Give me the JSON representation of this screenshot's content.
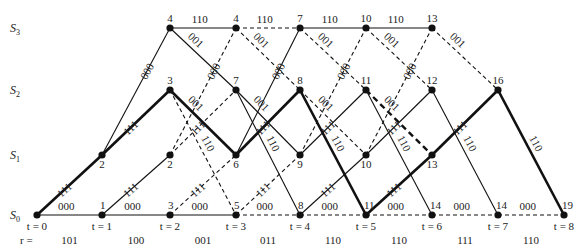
{
  "states": [
    {
      "id": "S0",
      "label": "S",
      "sub": "0"
    },
    {
      "id": "S1",
      "label": "S",
      "sub": "1"
    },
    {
      "id": "S2",
      "label": "S",
      "sub": "2"
    },
    {
      "id": "S3",
      "label": "S",
      "sub": "3"
    }
  ],
  "time_labels": [
    "t = 0",
    "t = 1",
    "t = 2",
    "t = 3",
    "t = 4",
    "t = 5",
    "t = 6",
    "t = 7",
    "t = 8"
  ],
  "received_prefix": "r =",
  "received": [
    "101",
    "100",
    "001",
    "011",
    "110",
    "110",
    "111",
    "110"
  ],
  "nodes": [
    {
      "t": 0,
      "s": 0,
      "metric": ""
    },
    {
      "t": 1,
      "s": 0,
      "metric": "1"
    },
    {
      "t": 1,
      "s": 1,
      "metric": "2"
    },
    {
      "t": 2,
      "s": 0,
      "metric": "3"
    },
    {
      "t": 2,
      "s": 1,
      "metric": "2"
    },
    {
      "t": 2,
      "s": 2,
      "metric": "3"
    },
    {
      "t": 2,
      "s": 3,
      "metric": "4"
    },
    {
      "t": 3,
      "s": 0,
      "metric": "5"
    },
    {
      "t": 3,
      "s": 1,
      "metric": "6"
    },
    {
      "t": 3,
      "s": 2,
      "metric": "7"
    },
    {
      "t": 3,
      "s": 3,
      "metric": "4"
    },
    {
      "t": 4,
      "s": 0,
      "metric": "8"
    },
    {
      "t": 4,
      "s": 1,
      "metric": "9"
    },
    {
      "t": 4,
      "s": 2,
      "metric": "8"
    },
    {
      "t": 4,
      "s": 3,
      "metric": "7"
    },
    {
      "t": 5,
      "s": 0,
      "metric": "11"
    },
    {
      "t": 5,
      "s": 1,
      "metric": "10"
    },
    {
      "t": 5,
      "s": 2,
      "metric": "11"
    },
    {
      "t": 5,
      "s": 3,
      "metric": "10"
    },
    {
      "t": 6,
      "s": 0,
      "metric": "14"
    },
    {
      "t": 6,
      "s": 1,
      "metric": "13"
    },
    {
      "t": 6,
      "s": 2,
      "metric": "12"
    },
    {
      "t": 6,
      "s": 3,
      "metric": "13"
    },
    {
      "t": 7,
      "s": 0,
      "metric": "14"
    },
    {
      "t": 7,
      "s": 2,
      "metric": "16"
    },
    {
      "t": 8,
      "s": 0,
      "metric": "19"
    }
  ],
  "edges": [
    {
      "t": 0,
      "from": 0,
      "to": 0,
      "label": "000",
      "style": "normal"
    },
    {
      "t": 0,
      "from": 0,
      "to": 1,
      "label": "111",
      "style": "bold"
    },
    {
      "t": 1,
      "from": 0,
      "to": 0,
      "label": "000",
      "style": "normal"
    },
    {
      "t": 1,
      "from": 0,
      "to": 1,
      "label": "111",
      "style": "normal"
    },
    {
      "t": 1,
      "from": 1,
      "to": 2,
      "label": "111",
      "style": "bold"
    },
    {
      "t": 1,
      "from": 1,
      "to": 3,
      "label": "000",
      "style": "normal"
    },
    {
      "t": 2,
      "from": 0,
      "to": 0,
      "label": "000",
      "style": "normal"
    },
    {
      "t": 2,
      "from": 0,
      "to": 1,
      "label": "111",
      "style": "dashed"
    },
    {
      "t": 2,
      "from": 1,
      "to": 2,
      "label": "111",
      "style": "dashed"
    },
    {
      "t": 2,
      "from": 1,
      "to": 3,
      "label": "000",
      "style": "dashed"
    },
    {
      "t": 2,
      "from": 2,
      "to": 0,
      "label": "110",
      "style": "dashed"
    },
    {
      "t": 2,
      "from": 2,
      "to": 1,
      "label": "001",
      "style": "bold"
    },
    {
      "t": 2,
      "from": 3,
      "to": 2,
      "label": "001",
      "style": "normal"
    },
    {
      "t": 2,
      "from": 3,
      "to": 3,
      "label": "110",
      "style": "normal"
    },
    {
      "t": 3,
      "from": 0,
      "to": 0,
      "label": "000",
      "style": "dashed"
    },
    {
      "t": 3,
      "from": 0,
      "to": 1,
      "label": "111",
      "style": "dashed"
    },
    {
      "t": 3,
      "from": 1,
      "to": 2,
      "label": "111",
      "style": "bold"
    },
    {
      "t": 3,
      "from": 1,
      "to": 3,
      "label": "000",
      "style": "normal"
    },
    {
      "t": 3,
      "from": 2,
      "to": 0,
      "label": "110",
      "style": "normal"
    },
    {
      "t": 3,
      "from": 2,
      "to": 1,
      "label": "001",
      "style": "normal"
    },
    {
      "t": 3,
      "from": 3,
      "to": 2,
      "label": "001",
      "style": "dashed"
    },
    {
      "t": 3,
      "from": 3,
      "to": 3,
      "label": "110",
      "style": "dashed"
    },
    {
      "t": 4,
      "from": 0,
      "to": 0,
      "label": "000",
      "style": "dashed"
    },
    {
      "t": 4,
      "from": 0,
      "to": 1,
      "label": "111",
      "style": "normal"
    },
    {
      "t": 4,
      "from": 1,
      "to": 2,
      "label": "111",
      "style": "normal"
    },
    {
      "t": 4,
      "from": 1,
      "to": 3,
      "label": "000",
      "style": "dashed"
    },
    {
      "t": 4,
      "from": 2,
      "to": 0,
      "label": "110",
      "style": "bold"
    },
    {
      "t": 4,
      "from": 2,
      "to": 1,
      "label": "001",
      "style": "dashed"
    },
    {
      "t": 4,
      "from": 3,
      "to": 2,
      "label": "001",
      "style": "dashed"
    },
    {
      "t": 4,
      "from": 3,
      "to": 3,
      "label": "110",
      "style": "normal"
    },
    {
      "t": 5,
      "from": 0,
      "to": 0,
      "label": "000",
      "style": "dashed"
    },
    {
      "t": 5,
      "from": 0,
      "to": 1,
      "label": "111",
      "style": "bold"
    },
    {
      "t": 5,
      "from": 1,
      "to": 2,
      "label": "111",
      "style": "normal"
    },
    {
      "t": 5,
      "from": 1,
      "to": 3,
      "label": "000",
      "style": "dashed"
    },
    {
      "t": 5,
      "from": 2,
      "to": 0,
      "label": "110",
      "style": "normal"
    },
    {
      "t": 5,
      "from": 2,
      "to": 1,
      "label": "001",
      "style": "bolddash"
    },
    {
      "t": 5,
      "from": 3,
      "to": 2,
      "label": "001",
      "style": "dashed"
    },
    {
      "t": 5,
      "from": 3,
      "to": 3,
      "label": "110",
      "style": "normal"
    },
    {
      "t": 6,
      "from": 0,
      "to": 0,
      "label": "000",
      "style": "dashed"
    },
    {
      "t": 6,
      "from": 1,
      "to": 2,
      "label": "111",
      "style": "bold"
    },
    {
      "t": 6,
      "from": 2,
      "to": 0,
      "label": "110",
      "style": "normal"
    },
    {
      "t": 6,
      "from": 3,
      "to": 2,
      "label": "001",
      "style": "dashed"
    },
    {
      "t": 7,
      "from": 0,
      "to": 0,
      "label": "000",
      "style": "dashed"
    },
    {
      "t": 7,
      "from": 2,
      "to": 0,
      "label": "110",
      "style": "bold"
    }
  ]
}
